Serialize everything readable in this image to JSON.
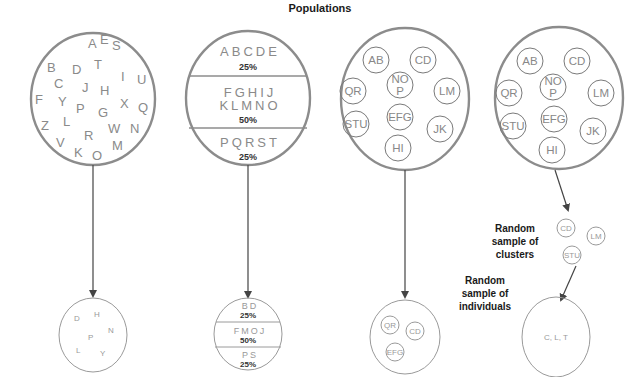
{
  "title": "Populations",
  "colors": {
    "outline": "#8c8c8c",
    "text_gray": "#8a8a8a",
    "label_dark": "#1a1a1a",
    "arrow": "#444444"
  },
  "simple_random": {
    "population_letters": [
      "A",
      "E",
      "S",
      "B",
      "D",
      "T",
      "I",
      "U",
      "C",
      "J",
      "H",
      "F",
      "Y",
      "P",
      "X",
      "Q",
      "G",
      "Z",
      "L",
      "W",
      "N",
      "R",
      "V",
      "K",
      "O",
      "M"
    ],
    "sample_letters": [
      "D",
      "H",
      "N",
      "P",
      "L",
      "Y"
    ]
  },
  "stratified": {
    "population": [
      {
        "letters": "ABCDE",
        "pct": "25%"
      },
      {
        "letters_line1": "FGHIJ",
        "letters_line2": "KLMNO",
        "pct": "50%"
      },
      {
        "letters": "PQRST",
        "pct": "25%"
      }
    ],
    "sample": [
      {
        "letters": "BD",
        "pct": "25%"
      },
      {
        "letters": "FMOJ",
        "pct": "50%"
      },
      {
        "letters": "PS",
        "pct": "25%"
      }
    ]
  },
  "cluster": {
    "population_clusters": [
      "AB",
      "CD",
      "NO P",
      "QR",
      "LM",
      "STU",
      "EFG",
      "JK",
      "HI"
    ],
    "sample_clusters": [
      "QR",
      "CD",
      "EFG"
    ]
  },
  "multistage": {
    "population_clusters": [
      "AB",
      "CD",
      "NO P",
      "QR",
      "LM",
      "STU",
      "EFG",
      "JK",
      "HI"
    ],
    "cluster_sample_label": [
      "Random",
      "sample of",
      "clusters"
    ],
    "sampled_clusters": [
      "CD",
      "LM",
      "STU"
    ],
    "individual_sample_label": [
      "Random",
      "sample of",
      "individuals"
    ],
    "sampled_individuals": "C, L, T"
  }
}
